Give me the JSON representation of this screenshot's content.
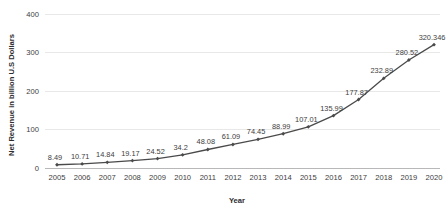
{
  "chart_data": {
    "type": "line",
    "title": "",
    "xlabel": "Year",
    "ylabel": "Net Revenue in billion U.S Dollars",
    "categories": [
      "2005",
      "2006",
      "2007",
      "2008",
      "2009",
      "2010",
      "2011",
      "2012",
      "2013",
      "2014",
      "2015",
      "2016",
      "2017",
      "2018",
      "2019",
      "2020"
    ],
    "values": [
      8.49,
      10.71,
      14.84,
      19.17,
      24.52,
      34.2,
      48.08,
      61.09,
      74.45,
      88.99,
      107.01,
      135.99,
      177.87,
      232.89,
      280.52,
      320.346
    ],
    "value_labels": [
      "8.49",
      "10.71",
      "14.84",
      "19.17",
      "24.52",
      "34.2",
      "48.08",
      "61.09",
      "74.45",
      "88.99",
      "107.01",
      "135.99",
      "177.87",
      "232.89",
      "280.52",
      "320.346"
    ],
    "ylim": [
      0,
      400
    ],
    "yticks": [
      0,
      100,
      200,
      300,
      400
    ],
    "ytick_labels": [
      "0",
      "100",
      "200",
      "300",
      "400"
    ],
    "grid": true,
    "legend": false,
    "series_color": "#4a4a4a",
    "grid_color": "#e8e8e8",
    "axis_color": "#b8b8b8",
    "marker": "diamond"
  }
}
